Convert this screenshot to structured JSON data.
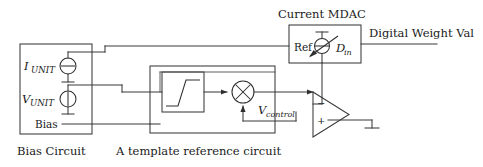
{
  "figure": {
    "kind": "circuit-diagram",
    "background_color": "#ffffff",
    "line_color": "#3a3a3a",
    "text_color": "#1a1a1a"
  },
  "titles": {
    "mdac_title": "Current MDAC",
    "digital_weight_label": "Digital Weight Val"
  },
  "captions": {
    "bias_circuit": "Bias Circuit",
    "template_circuit": "A template reference circuit"
  },
  "bias_block": {
    "sources": [
      {
        "name": "current-source",
        "label_main": "I",
        "label_sub": "UNIT",
        "symbol": "current-source-circle"
      },
      {
        "name": "voltage-source",
        "label_main": "V",
        "label_sub": "UNIT",
        "symbol": "voltage-source-circle"
      }
    ],
    "bias_label": "Bias"
  },
  "template_block": {
    "saturation_block_name": "sigmoid-transfer-block",
    "multiplier_symbol": "×",
    "control_label_main": "V",
    "control_label_sub": "control"
  },
  "mdac_block": {
    "ref_label": "Ref",
    "din_label_main": "D",
    "din_label_sub": "in",
    "source_symbol": "adjustable-current-source"
  },
  "opamp": {
    "minus_label": "−",
    "plus_label": "+",
    "ground_symbol": "ground"
  }
}
